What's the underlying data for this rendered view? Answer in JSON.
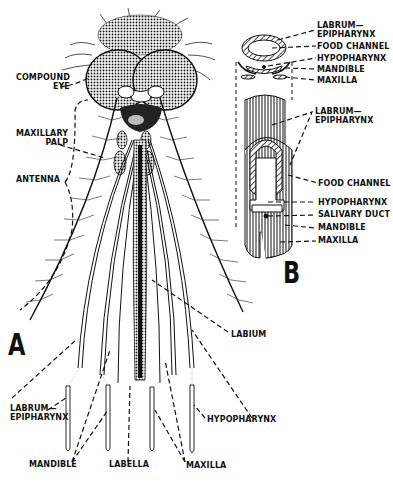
{
  "figure": {
    "panel_a": {
      "letter": "A",
      "labels": {
        "compound_eye": "COMPOUND EYE",
        "compound_eye_line1": "COMPOUND",
        "compound_eye_line2": "EYE",
        "maxillary_palp_line1": "MAXILLARY",
        "maxillary_palp_line2": "PALP",
        "antenna": "ANTENNA",
        "labium": "LABIUM",
        "labrum_epipharynx_line1": "LABRUM—",
        "labrum_epipharynx_line2": "EPIPHARYNX",
        "hypopharynx": "HYPOPHARYNX",
        "mandible": "MANDIBLE",
        "labella": "LABELLA",
        "maxilla": "MAXILLA"
      }
    },
    "panel_b": {
      "letter": "B",
      "cross_section_labels": {
        "labrum_line1": "LABRUM—",
        "labrum_line2": "EPIPHARYNX",
        "food_channel": "FOOD CHANNEL",
        "hypopharynx": "HYPOPHARYNX",
        "mandible": "MANDIBLE",
        "maxilla": "MAXILLA"
      },
      "cutaway_labels": {
        "labrum_line1": "LABRUM—",
        "labrum_line2": "EPIPHARYNX",
        "food_channel": "FOOD CHANNEL",
        "hypopharynx": "HYPOPHARYNX",
        "salivary_duct": "SALIVARY DUCT",
        "mandible": "MANDIBLE",
        "maxilla": "MAXILLA"
      }
    }
  }
}
